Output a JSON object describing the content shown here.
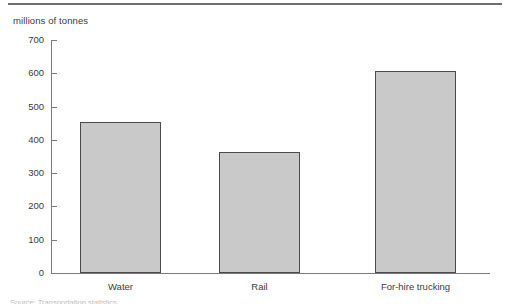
{
  "chart_data": {
    "type": "bar",
    "title": "",
    "subtitle": "",
    "categories": [
      "Water",
      "Rail",
      "For-hire trucking"
    ],
    "values": [
      455,
      365,
      608
    ],
    "xlabel": "",
    "ylabel": "millions of tonnes",
    "ylim": [
      0,
      700
    ],
    "ytick_labels": [
      "700",
      "600",
      "500",
      "400",
      "300",
      "200",
      "100",
      "0"
    ],
    "ytick_values": [
      700,
      600,
      500,
      400,
      300,
      200,
      100,
      0
    ],
    "grid": false,
    "legend": null,
    "series": [
      {
        "name": "Tonnage",
        "values": [
          455,
          365,
          608
        ]
      }
    ],
    "colors": {
      "bar_fill": "#c9c9c9",
      "bar_border": "#4a4a4a",
      "axis": "#7a7a7a",
      "text": "#3a3a3a",
      "rule": "#6e6e6e"
    }
  },
  "figure": {
    "unit_label": "millions of tonnes",
    "footnote": "Source: Transportation statistics."
  }
}
